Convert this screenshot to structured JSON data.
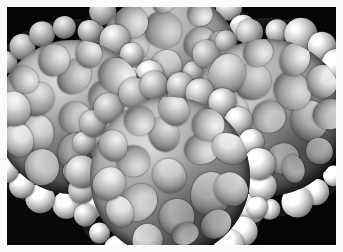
{
  "image": {
    "kind": "electron-micrograph",
    "modality": "transmission electron microscopy",
    "subject": "icosahedral virus particles (capsids) with surface spikes",
    "palette": "grayscale",
    "background_color": "#050505",
    "frame_color": "#fbfbfb",
    "highlight_color": "#ffffff",
    "midtone_color": "#9b9b9b",
    "shadow_color": "#1d1d1d",
    "width_px": 343,
    "height_px": 252,
    "frame_inset_px": 7,
    "caption": ""
  },
  "particles": [
    {
      "id": "particle-top",
      "label": "virus particle top",
      "cx_pct": 49.0,
      "cy_pct": 24.5,
      "diameter_pct": 27.0,
      "spike_count": 22,
      "capsomere_count": 17,
      "rotation_deg": 6
    },
    {
      "id": "particle-left",
      "label": "virus particle left",
      "cx_pct": 20.0,
      "cy_pct": 46.0,
      "diameter_pct": 28.5,
      "spike_count": 23,
      "capsomere_count": 18,
      "rotation_deg": 14
    },
    {
      "id": "particle-right",
      "label": "virus particle right",
      "cx_pct": 79.0,
      "cy_pct": 46.5,
      "diameter_pct": 29.0,
      "spike_count": 23,
      "capsomere_count": 18,
      "rotation_deg": -9
    },
    {
      "id": "particle-bottom",
      "label": "virus particle bottom",
      "cx_pct": 49.5,
      "cy_pct": 71.5,
      "diameter_pct": 29.5,
      "spike_count": 24,
      "capsomere_count": 18,
      "rotation_deg": 3
    }
  ]
}
